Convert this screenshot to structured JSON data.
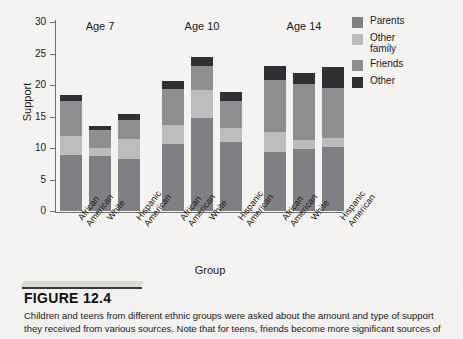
{
  "figure": {
    "number": "FIGURE 12.4",
    "caption": "Children and teens from different ethnic groups were asked about the amount and type of support they received from various sources. Note that for teens, friends become more significant sources of"
  },
  "chart_data": {
    "type": "bar",
    "stacked": true,
    "title": "",
    "xlabel": "Group",
    "ylabel": "Support",
    "ylim": [
      0,
      30
    ],
    "yticks": [
      0,
      5,
      10,
      15,
      20,
      25,
      30
    ],
    "grid": false,
    "legend_position": "top-right",
    "group_labels": [
      "Age 7",
      "Age 10",
      "Age 14"
    ],
    "categories": [
      "African American",
      "White",
      "Hispanic American",
      "African American",
      "White",
      "Hispanic American",
      "African American",
      "White",
      "Hispanic American"
    ],
    "series": [
      {
        "name": "Parents",
        "color": "#7f8083",
        "values": [
          8.9,
          8.7,
          8.2,
          10.7,
          14.7,
          11.0,
          9.3,
          9.9,
          10.1
        ]
      },
      {
        "name": "Other family",
        "color": "#bcbcbc",
        "values": [
          3.0,
          1.3,
          3.3,
          2.9,
          4.5,
          2.1,
          3.3,
          1.4,
          1.5
        ]
      },
      {
        "name": "Friends",
        "color": "#8d8e90",
        "values": [
          5.6,
          2.9,
          2.9,
          5.8,
          3.8,
          4.3,
          8.2,
          8.9,
          8.0
        ]
      },
      {
        "name": "Other",
        "color": "#2f3033",
        "values": [
          0.9,
          0.6,
          1.0,
          1.2,
          1.5,
          1.5,
          2.2,
          1.7,
          3.2
        ]
      }
    ],
    "totals": [
      18.4,
      13.5,
      15.4,
      20.6,
      24.5,
      18.9,
      23.0,
      21.9,
      22.8
    ]
  },
  "legend": {
    "items": [
      {
        "label": "Parents",
        "color": "#7f8083"
      },
      {
        "label": "Other\nfamily",
        "color": "#bcbcbc"
      },
      {
        "label": "Friends",
        "color": "#8d8e90"
      },
      {
        "label": "Other",
        "color": "#2f3033"
      }
    ]
  }
}
